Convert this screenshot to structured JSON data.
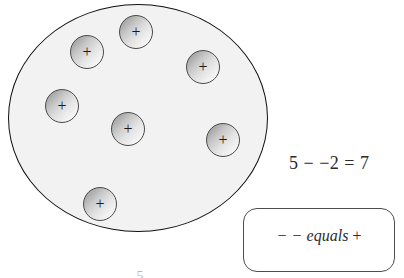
{
  "figure": {
    "title_clipped": "5",
    "counter_group": {
      "name": "oval-counter-group",
      "fill_color": "#f2f2f2",
      "outline_color": "#111111",
      "counter_count": 7,
      "counters": [
        {
          "sign": "+",
          "x": 110,
          "y": 10
        },
        {
          "sign": "+",
          "x": 61,
          "y": 30
        },
        {
          "sign": "+",
          "x": 177,
          "y": 45
        },
        {
          "sign": "+",
          "x": 36,
          "y": 84
        },
        {
          "sign": "+",
          "x": 102,
          "y": 107
        },
        {
          "sign": "+",
          "x": 197,
          "y": 118
        },
        {
          "sign": "+",
          "x": 74,
          "y": 182
        }
      ]
    }
  },
  "equation": {
    "text": "5 − −2 = 7",
    "minuend": "5",
    "operator": "−",
    "subtrahend": "−2",
    "equals": "=",
    "result": "7"
  },
  "legend": {
    "operator_pair": "− −",
    "word": "equals",
    "result_sign": "+",
    "full_text": "− − equals +"
  },
  "colors": {
    "group_fill": "#f2f2f2",
    "group_outline": "#111111",
    "counter_dark": "#8e8e8e",
    "counter_light": "#fafafa",
    "counter_outline": "#4a4a4a",
    "text": "#2b2b2b",
    "legend_border": "#4d4d4d",
    "background": "#ffffff"
  }
}
